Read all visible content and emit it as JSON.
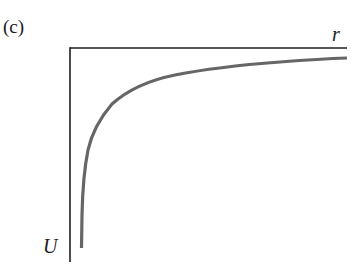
{
  "figure": {
    "panel_label": "(c)",
    "x_axis_label": "r",
    "y_axis_label": "U",
    "curve_description": "Potential energy U versus separation r: negative, approaching zero asymptotically as r increases, diverging to large negative values as r approaches zero",
    "colors": {
      "axes": "#1e1e1e",
      "curve": "#666666",
      "background": "#ffffff"
    }
  }
}
